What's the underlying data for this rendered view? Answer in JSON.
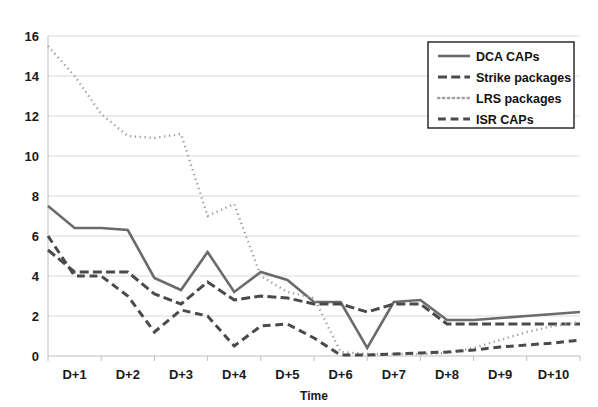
{
  "chart_data": {
    "type": "line",
    "title": "",
    "xlabel": "Time",
    "ylabel": "",
    "ylim": [
      0,
      16
    ],
    "ytick_step": 2,
    "yticks": [
      0,
      2,
      4,
      6,
      8,
      10,
      12,
      14,
      16
    ],
    "xticks": [
      "D+1",
      "D+2",
      "D+3",
      "D+4",
      "D+5",
      "D+6",
      "D+7",
      "D+8",
      "D+9",
      "D+10"
    ],
    "grid": true,
    "legend_position": "top-right",
    "x": [
      0.0,
      0.5,
      1.0,
      1.5,
      2.0,
      2.5,
      3.0,
      3.5,
      4.0,
      4.5,
      5.0,
      5.5,
      6.0,
      6.5,
      7.0,
      7.5,
      8.0,
      8.5,
      9.0,
      9.5,
      10.0
    ],
    "series": [
      {
        "name": "DCA CAPs",
        "style": "solid",
        "color": "#6b6b6b",
        "width": 2.6,
        "values": [
          7.5,
          6.4,
          6.4,
          6.3,
          3.9,
          3.3,
          5.2,
          3.2,
          4.2,
          3.8,
          2.7,
          2.7,
          0.4,
          2.7,
          2.8,
          1.8,
          1.8,
          1.9,
          2.0,
          2.1,
          2.2
        ]
      },
      {
        "name": "Strike packages",
        "style": "thick-dash",
        "color": "#4a4a4a",
        "width": 3.0,
        "values": [
          5.3,
          4.2,
          4.2,
          4.2,
          3.1,
          2.6,
          3.7,
          2.8,
          3.0,
          2.9,
          2.6,
          2.6,
          2.2,
          2.6,
          2.6,
          1.6,
          1.6,
          1.6,
          1.6,
          1.6,
          1.6
        ]
      },
      {
        "name": "LRS packages",
        "style": "dotted",
        "color": "#a0a0a0",
        "width": 2.4,
        "values": [
          15.5,
          14.0,
          12.1,
          11.0,
          10.9,
          11.1,
          7.0,
          7.6,
          4.0,
          3.2,
          2.9,
          0.2,
          0.1,
          0.1,
          0.1,
          0.15,
          0.4,
          0.8,
          1.2,
          1.5,
          1.7
        ]
      },
      {
        "name": "ISR CAPs",
        "style": "dash",
        "color": "#4a4a4a",
        "width": 3.0,
        "values": [
          6.0,
          4.0,
          4.0,
          3.0,
          1.2,
          2.3,
          2.0,
          0.5,
          1.5,
          1.6,
          0.9,
          0.05,
          0.05,
          0.1,
          0.15,
          0.2,
          0.3,
          0.45,
          0.55,
          0.65,
          0.8
        ]
      }
    ]
  },
  "legend": {
    "items": [
      {
        "label": "DCA CAPs",
        "swatch": "solid-line-swatch"
      },
      {
        "label": "Strike packages",
        "swatch": "thick-dash-swatch"
      },
      {
        "label": "LRS packages",
        "swatch": "dotted-line-swatch"
      },
      {
        "label": "ISR CAPs",
        "swatch": "dash-line-swatch"
      }
    ]
  },
  "axes": {
    "x_title": "Time",
    "y_labels": [
      "16",
      "14",
      "12",
      "10",
      "8",
      "6",
      "4",
      "2",
      "0"
    ],
    "x_labels": [
      "D+1",
      "D+2",
      "D+3",
      "D+4",
      "D+5",
      "D+6",
      "D+7",
      "D+8",
      "D+9",
      "D+10"
    ]
  }
}
